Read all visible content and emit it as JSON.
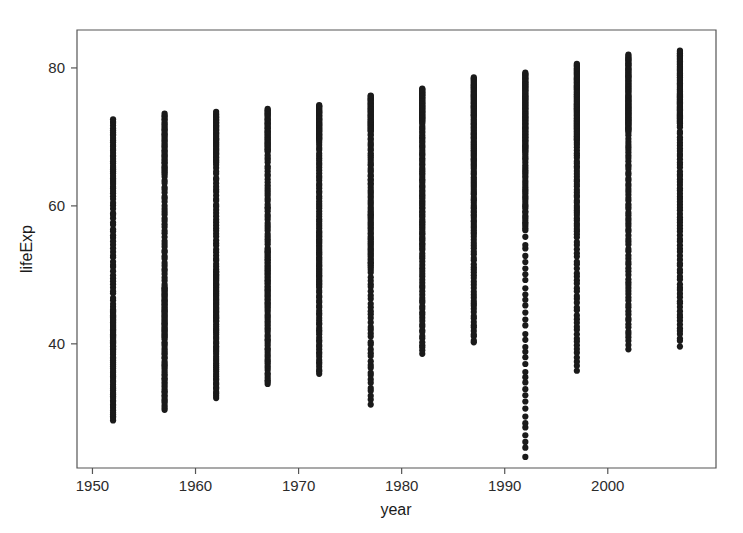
{
  "chart_data": {
    "type": "scatter",
    "title": "",
    "xlabel": "year",
    "ylabel": "lifeExp",
    "xlim": [
      1948.5,
      2010.5
    ],
    "ylim": [
      22.0,
      85.5
    ],
    "grid": false,
    "legend": null,
    "x_ticks": [
      1950,
      1960,
      1970,
      1980,
      1990,
      2000
    ],
    "x_tick_labels": [
      "1950",
      "1960",
      "1970",
      "1980",
      "1990",
      "2000"
    ],
    "y_ticks": [
      40,
      60,
      80
    ],
    "y_tick_labels": [
      "40",
      "60",
      "80"
    ],
    "point_color": "#1a1a1a",
    "point_radius_px": 3.1,
    "frame_color": "#555555",
    "background_color": "#ffffff",
    "n_points": 1704,
    "n_categories_per_year": 142,
    "categories": [
      1952,
      1957,
      1962,
      1967,
      1972,
      1977,
      1982,
      1987,
      1992,
      1997,
      2002,
      2007
    ],
    "series": [
      {
        "name": "lifeExp",
        "year_summaries": [
          {
            "year": 1952,
            "min": 28.8,
            "q1": 39.0,
            "median": 45.1,
            "q3": 61.9,
            "max": 72.7,
            "mean": 49.1
          },
          {
            "year": 1957,
            "min": 30.3,
            "q1": 41.2,
            "median": 48.4,
            "q3": 64.6,
            "max": 73.5,
            "mean": 51.5
          },
          {
            "year": 1962,
            "min": 32.0,
            "q1": 43.2,
            "median": 50.9,
            "q3": 66.3,
            "max": 73.7,
            "mean": 53.6
          },
          {
            "year": 1967,
            "min": 34.0,
            "q1": 45.6,
            "median": 53.8,
            "q3": 67.8,
            "max": 74.2,
            "mean": 55.7
          },
          {
            "year": 1972,
            "min": 35.4,
            "q1": 48.1,
            "median": 56.5,
            "q3": 69.5,
            "max": 74.7,
            "mean": 57.6
          },
          {
            "year": 1977,
            "min": 31.2,
            "q1": 50.9,
            "median": 59.7,
            "q3": 70.8,
            "max": 76.1,
            "mean": 59.6
          },
          {
            "year": 1982,
            "min": 38.4,
            "q1": 53.6,
            "median": 62.4,
            "q3": 72.2,
            "max": 77.1,
            "mean": 61.5
          },
          {
            "year": 1987,
            "min": 39.9,
            "q1": 55.6,
            "median": 65.8,
            "q3": 73.0,
            "max": 78.7,
            "mean": 63.2
          },
          {
            "year": 1992,
            "min": 23.6,
            "q1": 56.4,
            "median": 67.7,
            "q3": 73.9,
            "max": 79.4,
            "mean": 64.2
          },
          {
            "year": 1997,
            "min": 36.1,
            "q1": 55.9,
            "median": 69.4,
            "q3": 74.9,
            "max": 80.7,
            "mean": 65.0
          },
          {
            "year": 2002,
            "min": 39.2,
            "q1": 56.2,
            "median": 70.8,
            "q3": 75.8,
            "max": 82.0,
            "mean": 65.7
          },
          {
            "year": 2007,
            "min": 39.6,
            "q1": 57.2,
            "median": 71.9,
            "q3": 76.4,
            "max": 82.6,
            "mean": 67.0
          }
        ],
        "notable_outliers": [
          {
            "year": 1977,
            "lifeExp": 31.2,
            "note": "low-outlier"
          },
          {
            "year": 1992,
            "lifeExp": 23.6,
            "note": "low-outlier"
          },
          {
            "year": 1997,
            "lifeExp": 36.1,
            "note": "low-outlier"
          },
          {
            "year": 2002,
            "lifeExp": 39.2,
            "note": "low-outlier"
          },
          {
            "year": 2007,
            "lifeExp": 39.6,
            "note": "low-outlier"
          }
        ]
      }
    ]
  },
  "axes": {
    "x_title": "year",
    "y_title": "lifeExp"
  }
}
